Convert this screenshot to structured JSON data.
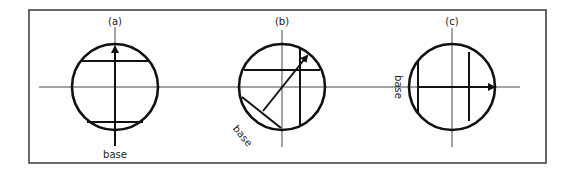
{
  "diagram": {
    "panels": [
      {
        "id": "a",
        "label": "(a)",
        "base_label": "base"
      },
      {
        "id": "b",
        "label": "(b)",
        "base_label": "base"
      },
      {
        "id": "c",
        "label": "(c)",
        "base_label": "base"
      }
    ],
    "colors": {
      "line": "#111111",
      "frame": "#444444",
      "background": "#ffffff"
    }
  }
}
